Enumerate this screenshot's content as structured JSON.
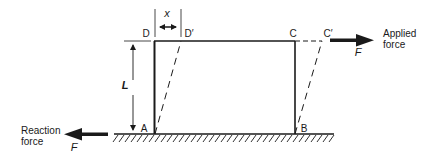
{
  "diagram": {
    "points": {
      "A": "A",
      "B": "B",
      "C": "C",
      "D": "D",
      "C_prime": "C′",
      "D_prime": "D′"
    },
    "dimensions": {
      "displacement": "x",
      "height": "L"
    },
    "applied_force": {
      "label_line1": "Applied",
      "label_line2": "force",
      "symbol": "F"
    },
    "reaction_force": {
      "label_line1": "Reaction",
      "label_line2": "force",
      "symbol": "F"
    },
    "colors": {
      "line": "#1a1a1a",
      "background": "#ffffff"
    }
  }
}
